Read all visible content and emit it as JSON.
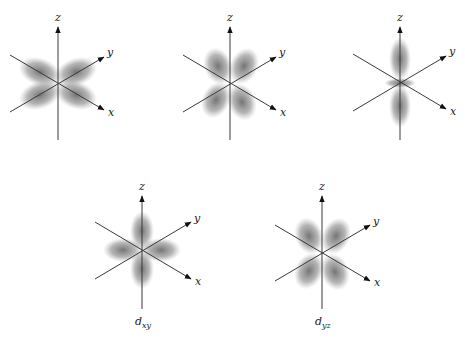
{
  "figure": {
    "panels": [
      {
        "id": "p1",
        "orbital": "lobes between z and x/y axes (left-right butterfly)",
        "caption": "",
        "cx": 58,
        "cy": 83,
        "axes": {
          "z": "z",
          "y": "y",
          "x": "x"
        }
      },
      {
        "id": "p2",
        "orbital": "four lobes along diagonals",
        "caption": "",
        "cx": 230,
        "cy": 83,
        "axes": {
          "z": "z",
          "y": "y",
          "x": "x"
        }
      },
      {
        "id": "p3",
        "orbital": "dz2-like lobes along z with torus",
        "caption": "",
        "cx": 400,
        "cy": 82,
        "axes": {
          "z": "z",
          "y": "y",
          "x": "x"
        }
      },
      {
        "id": "p4",
        "orbital": "d_xy",
        "caption_main": "d",
        "caption_sub": "xy",
        "cx": 142,
        "cy": 250,
        "axes": {
          "z": "z",
          "y": "y",
          "x": "x"
        }
      },
      {
        "id": "p5",
        "orbital": "d_yz",
        "caption_main": "d",
        "caption_sub": "yz",
        "cx": 322,
        "cy": 253,
        "axes": {
          "z": "z",
          "y": "y",
          "x": "x"
        }
      }
    ],
    "colors": {
      "lobe": "#6e6e6e",
      "axis": "#3a3a3a",
      "background": "#ffffff"
    }
  }
}
